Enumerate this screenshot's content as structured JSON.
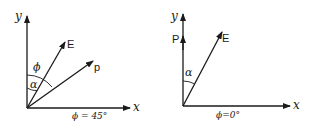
{
  "diagrams": [
    {
      "id": "left",
      "axis_x_label": "x",
      "axis_y_label": "y",
      "vectors": [
        {
          "label": "E"
        },
        {
          "label": "p"
        }
      ],
      "angle_labels": {
        "phi": "ϕ",
        "alpha": "α"
      },
      "caption": "ϕ = 45°"
    },
    {
      "id": "right",
      "axis_x_label": "x",
      "axis_y_label": "y",
      "vectors": [
        {
          "label": "P"
        },
        {
          "label": "E"
        }
      ],
      "angle_labels": {
        "alpha": "α"
      },
      "caption": "ϕ=0°"
    }
  ],
  "colors": {
    "ink": "#1a1a1a",
    "background": "#ffffff"
  }
}
